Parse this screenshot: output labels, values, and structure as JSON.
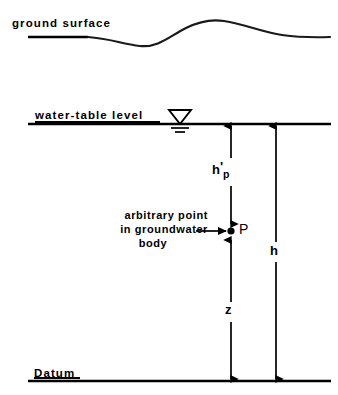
{
  "diagram": {
    "stroke_color": "#000000",
    "background_color": "#ffffff",
    "labels": {
      "ground_surface": "ground surface",
      "water_table_level": "water-table level",
      "datum": "Datum",
      "point_marker": "P",
      "pressure_head_base": "h",
      "pressure_head_prime": "'",
      "pressure_head_subscript": "p",
      "elevation_head": "z",
      "total_head": "h"
    },
    "callout": {
      "line1": "arbitrary point",
      "line2": "in groundwater",
      "line3": "body"
    },
    "icons": {
      "water_table_symbol": "water-table-triangle-icon",
      "point_marker_dot": "point-dot-icon",
      "callout_arrow": "callout-arrow-icon"
    }
  }
}
